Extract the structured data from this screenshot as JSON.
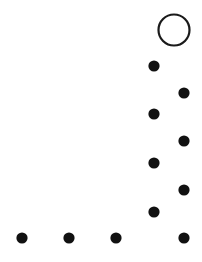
{
  "figure": {
    "width": 202,
    "height": 262,
    "background_color": "#ffffff",
    "marker_color": "#111111",
    "ring_stroke_color": "#1a1a1a",
    "ring_fill_color": "#ffffff",
    "ring_stroke_width": 2.2,
    "dot_radius": 5.6,
    "ring_radius": 15.5
  },
  "chart_data": {
    "type": "scatter",
    "title": "",
    "subtitle": "",
    "xlabel": "",
    "ylabel": "",
    "xlim": [
      0,
      202
    ],
    "ylim": [
      0,
      262
    ],
    "grid": false,
    "axes_visible": false,
    "tick_labels_x": [],
    "tick_labels_y": [],
    "legend": [],
    "annotations": [],
    "series": [
      {
        "name": "filled-markers",
        "marker": "filled-circle",
        "color": "#111111",
        "radius": 5.6,
        "points": [
          {
            "id": "dot-col-left-1",
            "x": 154,
            "y": 66
          },
          {
            "id": "dot-col-right-1",
            "x": 184,
            "y": 93
          },
          {
            "id": "dot-col-left-2",
            "x": 154,
            "y": 114
          },
          {
            "id": "dot-col-right-2",
            "x": 184,
            "y": 141
          },
          {
            "id": "dot-col-left-3",
            "x": 154,
            "y": 163
          },
          {
            "id": "dot-col-right-3",
            "x": 184,
            "y": 190
          },
          {
            "id": "dot-col-left-4",
            "x": 154,
            "y": 212
          },
          {
            "id": "dot-row-bottom-1",
            "x": 22,
            "y": 238
          },
          {
            "id": "dot-row-bottom-2",
            "x": 69,
            "y": 238
          },
          {
            "id": "dot-row-bottom-3",
            "x": 116,
            "y": 238
          },
          {
            "id": "dot-row-bottom-4",
            "x": 184,
            "y": 238
          }
        ]
      },
      {
        "name": "open-marker",
        "marker": "open-circle",
        "color": "#1a1a1a",
        "radius": 15.5,
        "points": [
          {
            "id": "ring-top-right",
            "x": 174,
            "y": 30
          }
        ]
      }
    ]
  }
}
